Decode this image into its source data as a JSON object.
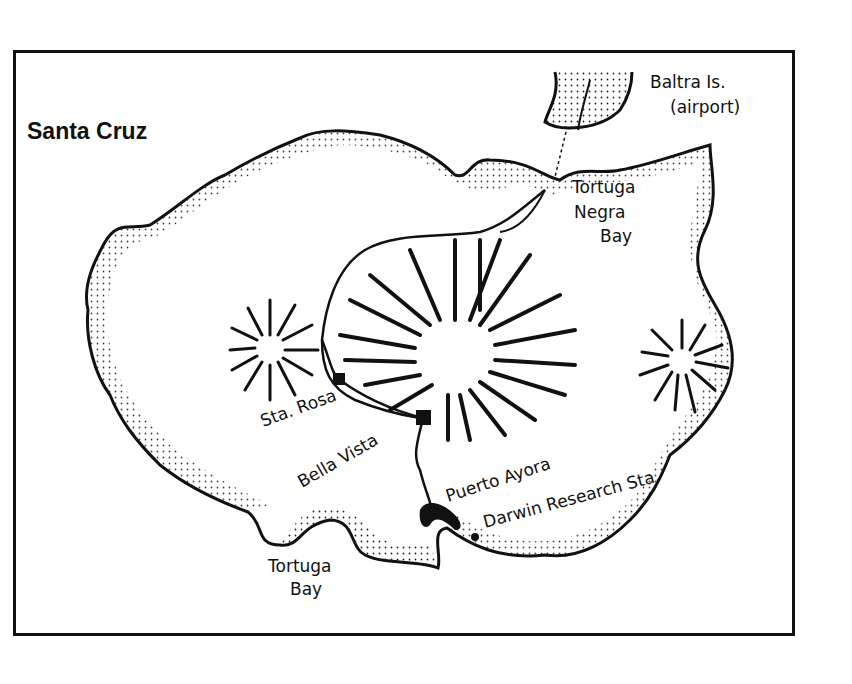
{
  "map": {
    "title": "Santa Cruz",
    "labels": {
      "baltra": "Baltra Is.",
      "airport": "(airport)",
      "tortuga_negra_1": "Tortuga",
      "tortuga_negra_2": "Negra",
      "tortuga_negra_3": "Bay",
      "sta_rosa": "Sta. Rosa",
      "bella_vista": "Bella Vista",
      "puerto_ayora": "Puerto Ayora",
      "darwin": "Darwin Research Sta.",
      "tortuga_bay_1": "Tortuga",
      "tortuga_bay_2": "Bay"
    }
  }
}
